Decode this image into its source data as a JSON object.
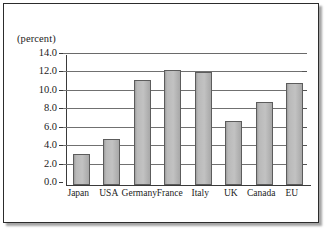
{
  "chart_data": {
    "type": "bar",
    "title": "",
    "xlabel": "",
    "ylabel": "(percent)",
    "categories": [
      "Japan",
      "USA",
      "Germany",
      "France",
      "Italy",
      "UK",
      "Canada",
      "EU"
    ],
    "values": [
      3.4,
      5.0,
      11.4,
      12.5,
      12.3,
      6.9,
      9.0,
      11.1
    ],
    "ylim": [
      0.0,
      14.0
    ],
    "ytick_labels": [
      "14.0",
      "12.0",
      "10.0",
      "8.0",
      "6.0",
      "4.0",
      "2.0",
      "0.0"
    ],
    "ytick_values": [
      14.0,
      12.0,
      10.0,
      8.0,
      6.0,
      4.0,
      2.0,
      0.0
    ],
    "grid": true,
    "legend": "none",
    "bar_color": "#bdbdbd",
    "bar_edge_color": "#5c5c5c",
    "gridline_color": "#707070",
    "axis_color": "#3a3a3a",
    "frame_color": "#2c2c2c",
    "background_color": "#ffffff"
  }
}
